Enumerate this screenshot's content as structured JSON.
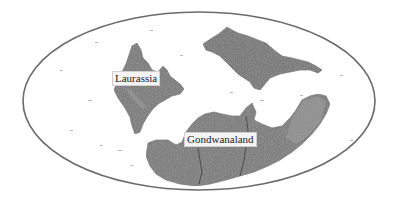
{
  "map": {
    "type": "world-projection-ellipse",
    "frame": {
      "stroke": "#6a6a6a",
      "fill": "#ffffff"
    },
    "land_color": "#6f6f6f",
    "land_light_color": "#9a9a9a",
    "labels": [
      {
        "id": "laurassia",
        "text": "Laurassia"
      },
      {
        "id": "gondwanaland",
        "text": "Gondwanaland"
      }
    ]
  }
}
